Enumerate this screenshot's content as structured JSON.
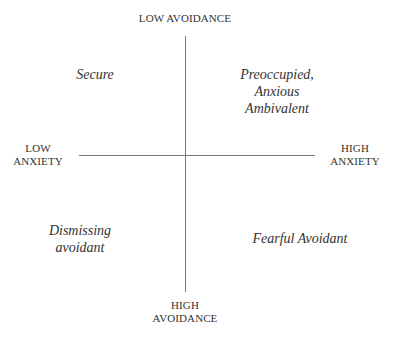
{
  "diagram": {
    "type": "quadrant",
    "axes": {
      "vertical": {
        "top_label": "LOW AVOIDANCE",
        "bottom_label_line1": "HIGH",
        "bottom_label_line2": "AVOIDANCE"
      },
      "horizontal": {
        "left_label_line1": "LOW",
        "left_label_line2": "ANXIETY",
        "right_label_line1": "HIGH",
        "right_label_line2": "ANXIETY"
      }
    },
    "quadrants": {
      "top_left": {
        "line1": "Secure"
      },
      "top_right": {
        "line1": "Preoccupied,",
        "line2": "Anxious",
        "line3": "Ambivalent"
      },
      "bottom_left": {
        "line1": "Dismissing",
        "line2": "avoidant"
      },
      "bottom_right": {
        "line1": "Fearful Avoidant"
      }
    },
    "colors": {
      "text": "#333333",
      "axis_line": "#777777",
      "background": "#ffffff"
    }
  }
}
